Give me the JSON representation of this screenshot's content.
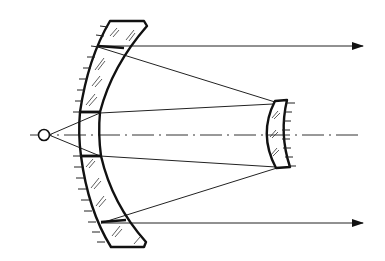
{
  "diagram": {
    "canvas": {
      "width": 385,
      "height": 261,
      "background": "#ffffff",
      "stroke": "#111111"
    },
    "optical_axis_y": 135,
    "elements": [
      {
        "id": "point-source",
        "type": "circle",
        "cx": 44,
        "cy": 135,
        "r": 5
      },
      {
        "id": "primary-mangin-mirror",
        "type": "meniscus-lens-with-reflective-back",
        "has_central_hole": true,
        "hole_y_range": [
          112,
          156
        ]
      },
      {
        "id": "secondary-mangin-mirror",
        "type": "meniscus-lens-with-reflective-back",
        "x_range": [
          265,
          290
        ],
        "y_range": [
          100,
          168
        ]
      }
    ],
    "rays": [
      {
        "from": [
          49,
          135
        ],
        "to": [
          100,
          113
        ]
      },
      {
        "from": [
          49,
          135
        ],
        "to": [
          100,
          156
        ]
      },
      {
        "from": [
          100,
          113
        ],
        "to": [
          273,
          104
        ]
      },
      {
        "from": [
          100,
          156
        ],
        "to": [
          276,
          167
        ]
      },
      {
        "from": [
          275,
          102
        ],
        "to": [
          98,
          47
        ]
      },
      {
        "from": [
          277,
          168
        ],
        "to": [
          101,
          223
        ]
      },
      {
        "from": [
          98,
          46
        ],
        "to": [
          360,
          46
        ],
        "arrow": true
      },
      {
        "from": [
          101,
          223
        ],
        "to": [
          360,
          223
        ],
        "arrow": true
      }
    ],
    "labels": []
  }
}
